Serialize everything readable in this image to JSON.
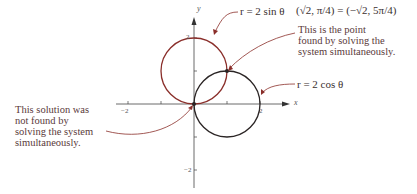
{
  "diagram": {
    "curves": [
      {
        "label": "r = 2 sin θ",
        "color": "#8a2e2a",
        "center": [
          0,
          1
        ],
        "radius": 1
      },
      {
        "label": "r = 2 cos θ",
        "color": "#2a2424",
        "center": [
          1,
          0
        ],
        "radius": 1
      }
    ],
    "intersection_label": "(√2, π/4) = (−√2, 5π/4)",
    "annotations": {
      "point_found": [
        "This is the point",
        "found by solving the",
        "system simultaneously."
      ],
      "point_not_found": [
        "This solution was",
        "not found by",
        "solving the system",
        "simultaneously."
      ]
    },
    "axes": {
      "x_label": "x",
      "y_label": "y",
      "x_ticks": [
        "−2",
        "2"
      ],
      "y_ticks": [
        "2",
        "−2"
      ]
    },
    "colors": {
      "sin_curve": "#8a2e2a",
      "cos_curve": "#2a2424",
      "axes": "#444444",
      "text": "#5a3a3a"
    }
  }
}
